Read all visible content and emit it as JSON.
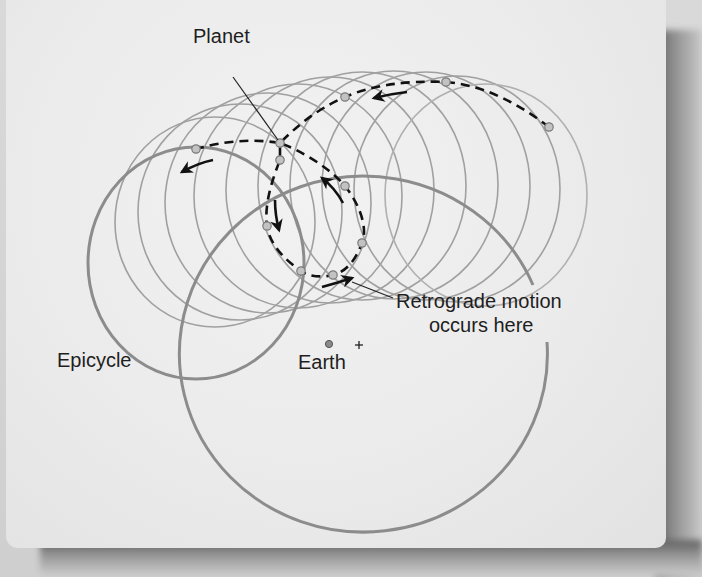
{
  "figure": {
    "labels": {
      "planet": "Planet",
      "retrograde_line1": "Retrograde motion",
      "retrograde_line2": "occurs here",
      "epicycle": "Epicycle",
      "earth": "Earth",
      "equant_marker": "+"
    },
    "colors": {
      "paper": "#ececec",
      "thin_circles": "#9a9a9a",
      "thick_circles": "#8a8a8a",
      "path": "#111111",
      "points": "#bdbdbd",
      "text": "#1e1e1e"
    },
    "planet_positions": [
      {
        "x": 549,
        "y": 127
      },
      {
        "x": 446,
        "y": 82
      },
      {
        "x": 345,
        "y": 97
      },
      {
        "x": 280,
        "y": 143
      },
      {
        "x": 345,
        "y": 186
      },
      {
        "x": 362,
        "y": 243
      },
      {
        "x": 333,
        "y": 275
      },
      {
        "x": 301,
        "y": 271
      },
      {
        "x": 267,
        "y": 226
      },
      {
        "x": 280,
        "y": 160
      },
      {
        "x": 196,
        "y": 149
      }
    ],
    "motion_arrows": [
      "westward-top",
      "westward-left",
      "retrograde-down",
      "retrograde-up",
      "prograde-bottom"
    ]
  }
}
